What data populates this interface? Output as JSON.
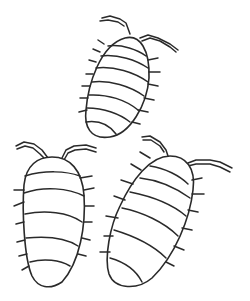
{
  "image": {
    "description": "Line drawing of three segmented woodlouse-like bugs with antennae and short legs",
    "colors": {
      "background": "#ffffff",
      "line": "#2a2a2a"
    },
    "bugs": [
      {
        "id": "top",
        "segments": 7
      },
      {
        "id": "bottom-left",
        "segments": 6
      },
      {
        "id": "bottom-right",
        "segments": 7
      }
    ]
  }
}
